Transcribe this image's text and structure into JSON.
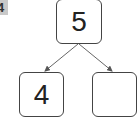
{
  "diagram": {
    "type": "number-bond",
    "corner_badge": "4",
    "whole": "5",
    "parts": [
      "4",
      ""
    ]
  }
}
